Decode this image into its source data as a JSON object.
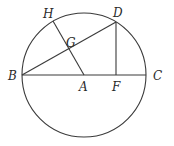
{
  "diagram": {
    "type": "geometry",
    "circle": {
      "cx": 84,
      "cy": 75,
      "r": 62
    },
    "points": {
      "A": {
        "label": "A",
        "x": 84,
        "y": 75,
        "lx": 79,
        "ly": 91
      },
      "B": {
        "label": "B",
        "x": 22,
        "y": 75,
        "lx": 8,
        "ly": 80
      },
      "C": {
        "label": "C",
        "x": 146,
        "y": 75,
        "lx": 153,
        "ly": 80
      },
      "D": {
        "label": "D",
        "x": 116,
        "y": 22,
        "lx": 113,
        "ly": 17
      },
      "F": {
        "label": "F",
        "x": 116,
        "y": 75,
        "lx": 112,
        "ly": 91
      },
      "G": {
        "label": "G",
        "x": 69,
        "y": 50,
        "lx": 66,
        "ly": 47
      },
      "H": {
        "label": "H",
        "x": 53,
        "y": 21,
        "lx": 43,
        "ly": 18
      }
    },
    "segments": [
      {
        "from": "B",
        "to": "C",
        "name": "diameter-BC"
      },
      {
        "from": "B",
        "to": "D",
        "name": "chord-BD"
      },
      {
        "from": "D",
        "to": "F",
        "name": "perpendicular-DF"
      },
      {
        "from": "H",
        "to": "A",
        "name": "radius-HA"
      }
    ],
    "colors": {
      "stroke": "#3a3a3a",
      "label": "#2a2a2a",
      "background": "#ffffff"
    }
  }
}
